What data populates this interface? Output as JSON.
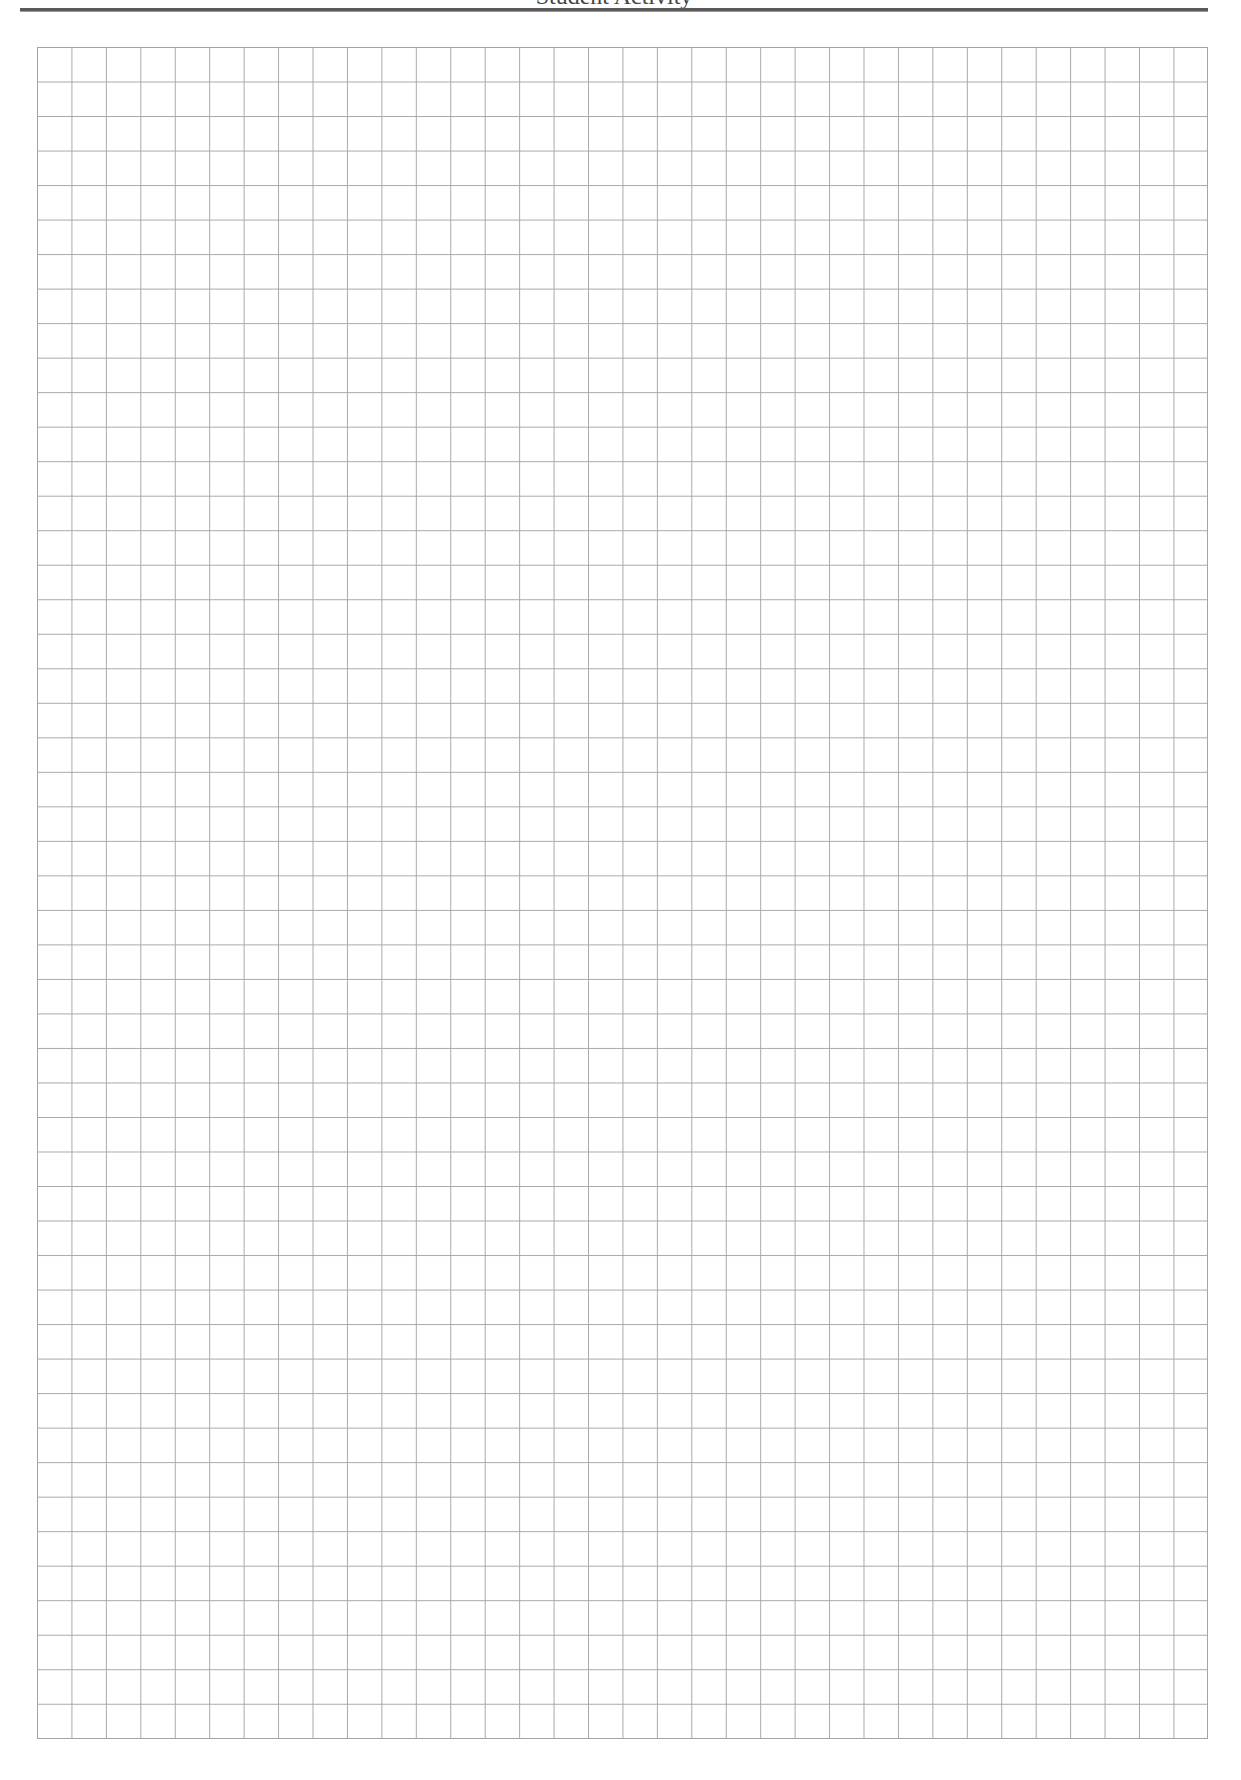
{
  "header": {
    "title": "Student Activity",
    "title_clipped": true
  },
  "grid": {
    "columns": 34,
    "rows": 49,
    "line_color": "#a8a8a8",
    "border_color": "#a4a4a4",
    "background": "#ffffff"
  },
  "colors": {
    "rule": "#5a5a5a",
    "text": "#444444"
  }
}
